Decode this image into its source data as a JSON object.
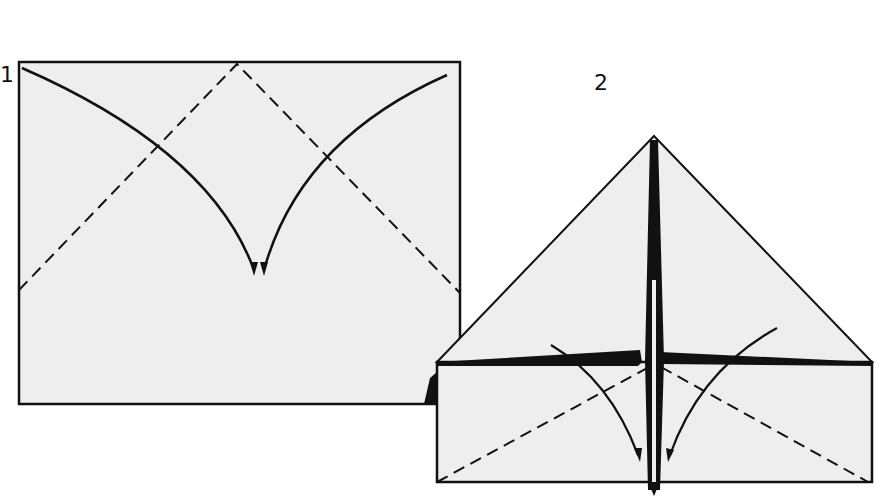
{
  "diagram": {
    "type": "origami-instructions",
    "paper_color": "#eeeeee",
    "line_color": "#111111",
    "steps": [
      {
        "label": "1",
        "description": "Rectangle with two diagonal valley-fold lines from top center to sides; two curved arrows from top corners to bottom center"
      },
      {
        "label": "2",
        "description": "Top folded into triangle; two diagonal valley folds on lower rectangle with curved arrows toward center"
      }
    ]
  }
}
